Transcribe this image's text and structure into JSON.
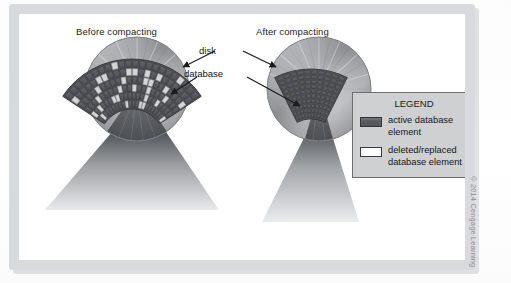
{
  "figure": {
    "kind": "textbook-illustration",
    "topic": "database compaction on disk"
  },
  "titles": {
    "before": "Before compacting",
    "after": "After compacting"
  },
  "callouts": {
    "disk": "disk",
    "database": "database"
  },
  "legend": {
    "title": "LEGEND",
    "items": [
      {
        "swatch": "dark-filled",
        "label": "active database element",
        "color": "#55585c"
      },
      {
        "swatch": "white-outline",
        "label": "deleted/replaced database element",
        "color": "#ffffff"
      }
    ]
  },
  "credit": "© 2014 Cengage Learning",
  "colors": {
    "frame": "#d9dade",
    "page": "#ffffff",
    "legend_bg": "#cfd0d2",
    "legend_border": "#6d6e70",
    "active_element": "#55585c",
    "deleted_element": "#ffffff",
    "disk_body": "#9b9ea2",
    "wedge_dark": "#55585c",
    "text": "#151517"
  },
  "chart_data": {
    "type": "diagram",
    "panels": [
      {
        "name": "before",
        "label": "Before compacting",
        "disk": {
          "cx": 118,
          "cy": 75,
          "r": 52,
          "hub_r": 11
        },
        "wedge": {
          "start_deg": 55,
          "end_deg": 125,
          "fill": "dark"
        },
        "fan": {
          "rings": 6,
          "sectors": 22,
          "fill": "mixed",
          "deleted_fraction": 0.28,
          "note": "grid of active (dark) cells interspersed with deleted/replaced (light) cells"
        }
      },
      {
        "name": "after",
        "label": "After compacting",
        "disk": {
          "cx": 300,
          "cy": 75,
          "r": 52,
          "hub_r": 11
        },
        "wedge": {
          "start_deg": 74,
          "end_deg": 106,
          "fill": "dark"
        },
        "fan": {
          "rings": 10,
          "sectors": 10,
          "fill": "all-active",
          "deleted_fraction": 0.0,
          "note": "contiguous block of active elements only"
        }
      }
    ],
    "annotations": [
      {
        "text": "disk",
        "points_to": [
          "before.disk.rim",
          "after.disk.rim"
        ]
      },
      {
        "text": "database",
        "points_to": [
          "before.disk.wedge",
          "after.disk.wedge"
        ]
      }
    ]
  }
}
